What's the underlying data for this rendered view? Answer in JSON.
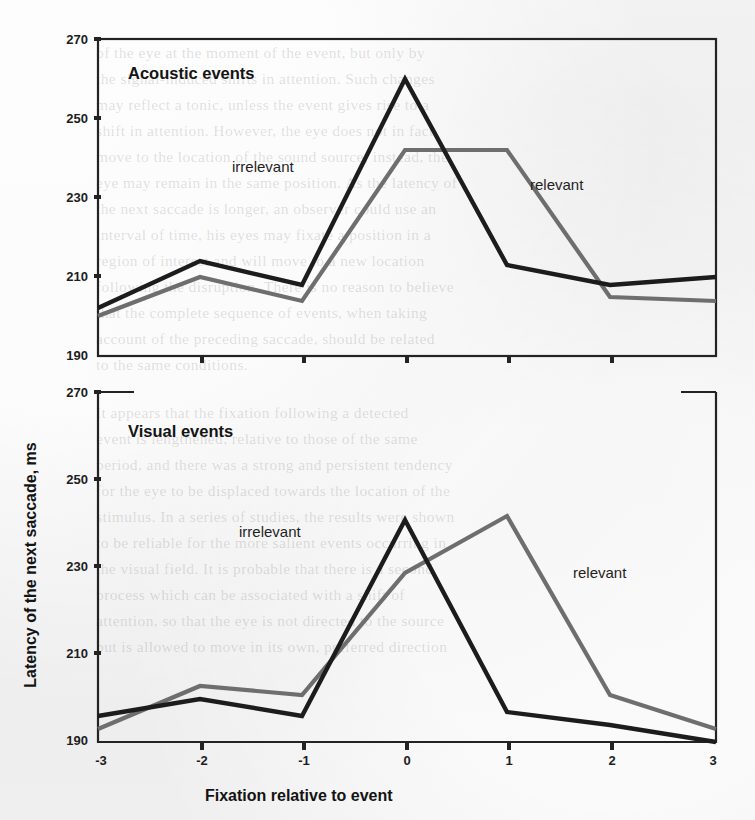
{
  "page": {
    "background_color": "#eeeeee",
    "ink_color": "#1a1a1a",
    "series_colors": {
      "irrelevant": "#1c1c1c",
      "relevant": "#6e6e6e"
    }
  },
  "axes": {
    "x_title": "Fixation relative to event",
    "y_title": "Latency of the next saccade, ms",
    "x_ticks": [
      "-3",
      "-2",
      "-1",
      "0",
      "1",
      "2",
      "3"
    ],
    "y_ticks": [
      "190",
      "210",
      "230",
      "250",
      "270"
    ]
  },
  "panels": [
    {
      "title": "Acoustic events",
      "label_irrelevant": "irrelevant",
      "label_relevant": "relevant"
    },
    {
      "title": "Visual events",
      "label_irrelevant": "irrelevant",
      "label_relevant": "relevant"
    }
  ],
  "ghost_text": [
    {
      "x": 96,
      "y": 44,
      "t": "of the eye at the moment of the event, but only by"
    },
    {
      "x": 96,
      "y": 70,
      "t": "the signal-induced shifts in attention. Such changes"
    },
    {
      "x": 96,
      "y": 96,
      "t": "may reflect a tonic, unless the event gives rise to a"
    },
    {
      "x": 96,
      "y": 122,
      "t": "shift in attention. However, the eye does not in fact"
    },
    {
      "x": 96,
      "y": 148,
      "t": "move to the location of the sound source; instead, the"
    },
    {
      "x": 96,
      "y": 174,
      "t": "eye may remain in the same position. As the latency of"
    },
    {
      "x": 96,
      "y": 200,
      "t": "the next saccade is longer, an observer could use an"
    },
    {
      "x": 96,
      "y": 226,
      "t": "interval of time, his eyes may fixate a position in a"
    },
    {
      "x": 96,
      "y": 252,
      "t": "region of interest and will move to a new location"
    },
    {
      "x": 96,
      "y": 278,
      "t": "following the disruption. There is no reason to believe"
    },
    {
      "x": 96,
      "y": 304,
      "t": "that the complete sequence of events, when taking"
    },
    {
      "x": 96,
      "y": 330,
      "t": "account of the preceding saccade, should be related"
    },
    {
      "x": 96,
      "y": 356,
      "t": "to the same conditions."
    },
    {
      "x": 96,
      "y": 404,
      "t": "It appears that the fixation following a detected"
    },
    {
      "x": 96,
      "y": 430,
      "t": "event is lengthened, relative to those of the same"
    },
    {
      "x": 96,
      "y": 456,
      "t": "period, and there was a strong and persistent tendency"
    },
    {
      "x": 96,
      "y": 482,
      "t": "for the eye to be displaced towards the location of the"
    },
    {
      "x": 96,
      "y": 508,
      "t": "stimulus. In a series of studies, the results were shown"
    },
    {
      "x": 96,
      "y": 534,
      "t": "to be reliable for the more salient events occurring in"
    },
    {
      "x": 96,
      "y": 560,
      "t": "the visual field. It is probable that there is a second"
    },
    {
      "x": 96,
      "y": 586,
      "t": "process which can be associated with a shift of"
    },
    {
      "x": 96,
      "y": 612,
      "t": "attention, so that the eye is not directed to the source"
    },
    {
      "x": 96,
      "y": 638,
      "t": "but is allowed to move in its own, preferred direction"
    }
  ],
  "chart_data": [
    {
      "type": "line",
      "title": "Acoustic events",
      "xlabel": "Fixation relative to event",
      "ylabel": "Latency of the next saccade, ms",
      "x": [
        -3,
        -2,
        -1,
        0,
        1,
        2,
        3
      ],
      "categories": [
        "-3",
        "-2",
        "-1",
        "0",
        "1",
        "2",
        "3"
      ],
      "ylim": [
        190,
        270
      ],
      "xlim": [
        -3,
        3
      ],
      "grid": false,
      "legend": "inline-annotations",
      "series": [
        {
          "name": "irrelevant",
          "color": "#1c1c1c",
          "values": [
            202,
            214,
            208,
            260,
            213,
            208,
            210
          ]
        },
        {
          "name": "relevant",
          "color": "#6e6e6e",
          "values": [
            200,
            210,
            204,
            242,
            242,
            205,
            204
          ]
        }
      ]
    },
    {
      "type": "line",
      "title": "Visual events",
      "xlabel": "Fixation relative to event",
      "ylabel": "Latency of the next saccade, ms",
      "x": [
        -3,
        -2,
        -1,
        0,
        1,
        2,
        3
      ],
      "categories": [
        "-3",
        "-2",
        "-1",
        "0",
        "1",
        "2",
        "3"
      ],
      "ylim": [
        190,
        270
      ],
      "xlim": [
        -3,
        3
      ],
      "grid": false,
      "legend": "inline-annotations",
      "series": [
        {
          "name": "irrelevant",
          "color": "#1c1c1c",
          "values": [
            200,
            204,
            200,
            244,
            201,
            198,
            194
          ]
        },
        {
          "name": "relevant",
          "color": "#6e6e6e",
          "values": [
            197,
            207,
            205,
            233,
            246,
            206,
            199
          ]
        }
      ]
    }
  ]
}
